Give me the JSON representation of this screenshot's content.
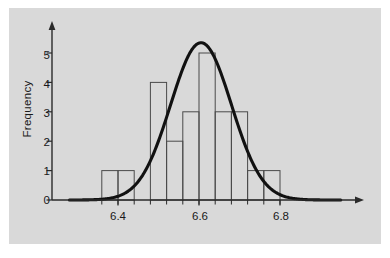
{
  "figure": {
    "background_color": "#ffffff",
    "panel_color": "#d9d9d9",
    "axis_color": "#2a2a2a",
    "bar_edge_color": "#4a4a4a",
    "curve_color": "#111111"
  },
  "axes": {
    "ylabel": "Frequency",
    "xlabel": "",
    "y_ticks": [
      "0",
      "1",
      "2",
      "3",
      "4",
      "5"
    ],
    "y_tick_values": [
      0,
      1,
      2,
      3,
      4,
      5
    ],
    "x_ticks": [
      "6.4",
      "6.6",
      "6.8"
    ],
    "x_tick_values": [
      6.4,
      6.6,
      6.8
    ],
    "xlim": [
      6.28,
      6.95
    ],
    "ylim": [
      0,
      5.6
    ],
    "grid": false,
    "legend": null
  },
  "chart_data": {
    "type": "bar",
    "title": "",
    "xlabel": "",
    "ylabel": "Frequency",
    "xlim": [
      6.28,
      6.95
    ],
    "ylim": [
      0,
      5.6
    ],
    "grid": false,
    "legend_position": "none",
    "bin_width": 0.04,
    "bin_edges": [
      6.36,
      6.4,
      6.44,
      6.48,
      6.52,
      6.56,
      6.6,
      6.64,
      6.68,
      6.72,
      6.76,
      6.8
    ],
    "categories": [
      "6.36-6.40",
      "6.40-6.44",
      "6.44-6.48",
      "6.48-6.52",
      "6.52-6.56",
      "6.56-6.60",
      "6.60-6.64",
      "6.64-6.68",
      "6.68-6.72",
      "6.72-6.76",
      "6.76-6.80"
    ],
    "values": [
      1,
      1,
      0,
      4,
      2,
      3,
      5,
      3,
      3,
      1,
      1
    ],
    "bars": [
      {
        "x0": 6.36,
        "x1": 6.4,
        "height": 1
      },
      {
        "x0": 6.4,
        "x1": 6.44,
        "height": 1
      },
      {
        "x0": 6.48,
        "x1": 6.52,
        "height": 4
      },
      {
        "x0": 6.52,
        "x1": 6.56,
        "height": 2
      },
      {
        "x0": 6.56,
        "x1": 6.6,
        "height": 3
      },
      {
        "x0": 6.6,
        "x1": 6.64,
        "height": 5
      },
      {
        "x0": 6.64,
        "x1": 6.68,
        "height": 3
      },
      {
        "x0": 6.68,
        "x1": 6.72,
        "height": 3
      },
      {
        "x0": 6.72,
        "x1": 6.76,
        "height": 1
      },
      {
        "x0": 6.76,
        "x1": 6.8,
        "height": 1
      }
    ],
    "overlay_curve": {
      "name": "normal-density",
      "type": "line",
      "peak_x": 6.605,
      "peak_y": 5.35,
      "mean": 6.605,
      "std": 0.075,
      "amplitude": 5.35
    },
    "total_count": 24
  }
}
